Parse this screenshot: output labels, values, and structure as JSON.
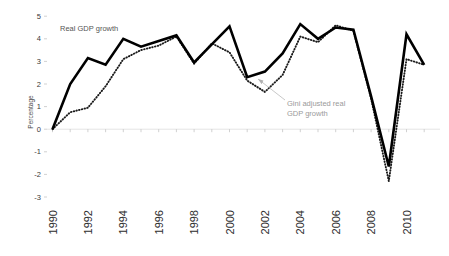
{
  "chart_data": {
    "type": "line",
    "title": "",
    "xlabel": "",
    "ylabel": "Percentage",
    "ylim": [
      -3,
      5
    ],
    "xlim": [
      1990,
      2011
    ],
    "grid": false,
    "legend_position": "inline-annotation",
    "ytick_labels": [
      "5",
      "4",
      "3",
      "2",
      "1",
      "0",
      "-1",
      "-2",
      "-3"
    ],
    "ytick_values": [
      5,
      4,
      3,
      2,
      1,
      0,
      -1,
      -2,
      -3
    ],
    "xtick_labels": [
      "1990",
      "1992",
      "1994",
      "1996",
      "1998",
      "2000",
      "2002",
      "2004",
      "2006",
      "2008",
      "2010"
    ],
    "xtick_values": [
      1990,
      1992,
      1994,
      1996,
      1998,
      2000,
      2002,
      2004,
      2006,
      2008,
      2010
    ],
    "x": [
      1990,
      1991,
      1992,
      1993,
      1994,
      1995,
      1996,
      1997,
      1998,
      1999,
      2000,
      2001,
      2002,
      2003,
      2004,
      2005,
      2006,
      2007,
      2008,
      2009,
      2010,
      2011
    ],
    "series": [
      {
        "name": "Real GDP growth",
        "style": "solid",
        "color": "#000000",
        "values": [
          0.0,
          2.0,
          3.15,
          2.85,
          4.0,
          3.65,
          3.9,
          4.15,
          2.95,
          3.75,
          4.55,
          2.3,
          2.55,
          3.35,
          4.65,
          4.0,
          4.5,
          4.4,
          1.45,
          -1.65,
          4.2,
          2.85
        ]
      },
      {
        "name": "Gini adjusted real GDP growth",
        "style": "dotted",
        "color": "#1a1a1a",
        "values": [
          0.0,
          0.75,
          0.95,
          1.9,
          3.1,
          3.5,
          3.7,
          4.1,
          2.9,
          3.8,
          3.4,
          2.15,
          1.65,
          2.4,
          4.1,
          3.85,
          4.6,
          4.35,
          1.35,
          -2.3,
          3.1,
          2.85
        ]
      }
    ],
    "annotations": [
      {
        "name": "real-gdp-growth-label",
        "text": "Real GDP growth",
        "x_px": 60,
        "y_px": 31
      },
      {
        "name": "gini-adjusted-label-line1",
        "text": "Gini adjusted real",
        "x_px": 287,
        "y_px": 106
      },
      {
        "name": "gini-adjusted-label-line2",
        "text": "GDP growth",
        "x_px": 287,
        "y_px": 116
      }
    ]
  }
}
